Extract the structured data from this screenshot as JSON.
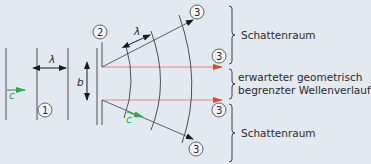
{
  "diagram": {
    "labels": {
      "lambda": "λ",
      "b": "b",
      "c": "c",
      "marker_1": "1",
      "marker_2": "2",
      "marker_3": "3"
    },
    "regions": [
      {
        "name": "shadow-top",
        "text": "Schattenraum"
      },
      {
        "name": "geometric",
        "text_line1": "erwarteter geometrisch",
        "text_line2": "begrenzter Wellenverlauf"
      },
      {
        "name": "shadow-bottom",
        "text": "Schattenraum"
      }
    ],
    "colors": {
      "background": "#e3e9f0",
      "lines": "#3a3f4a",
      "rays_geometric": "#e04a2a",
      "velocity_arrow": "#2ea84a"
    }
  }
}
